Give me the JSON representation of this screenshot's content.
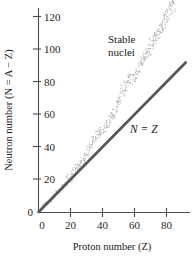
{
  "chart_data": {
    "type": "scatter",
    "title": "",
    "xlabel": "Proton number (Z)",
    "ylabel": "Neutron number (N = A − Z)",
    "xlim": [
      0,
      96
    ],
    "ylim": [
      0,
      132
    ],
    "xticks": [
      0,
      20,
      40,
      60,
      80
    ],
    "yticks": [
      0,
      20,
      40,
      60,
      80,
      100,
      120
    ],
    "grid": false,
    "legend": "none",
    "annotations": [
      {
        "text": "Stable nuclei",
        "x": 52,
        "y": 112
      },
      {
        "text": "N = Z",
        "x": 70,
        "y": 56
      }
    ],
    "series": [
      {
        "name": "N = Z",
        "type": "line",
        "color": "#575757",
        "x": [
          0,
          92
        ],
        "values": [
          0,
          92
        ]
      },
      {
        "name": "Stable nuclei",
        "type": "scatter",
        "color": "#9a9a9a",
        "x": [
          1,
          2,
          3,
          4,
          5,
          6,
          7,
          8,
          9,
          10,
          11,
          12,
          13,
          14,
          15,
          16,
          17,
          18,
          19,
          20,
          21,
          22,
          23,
          24,
          25,
          26,
          27,
          28,
          29,
          30,
          31,
          32,
          33,
          34,
          35,
          36,
          37,
          38,
          39,
          40,
          41,
          42,
          43,
          44,
          45,
          46,
          47,
          48,
          49,
          50,
          51,
          52,
          53,
          54,
          55,
          56,
          57,
          58,
          59,
          60,
          61,
          62,
          63,
          64,
          65,
          66,
          67,
          68,
          69,
          70,
          71,
          72,
          73,
          74,
          75,
          76,
          77,
          78,
          79,
          80,
          81,
          82,
          83,
          84,
          86,
          88,
          90,
          92
        ],
        "values": [
          1,
          2,
          4,
          5,
          6,
          6,
          7,
          8,
          10,
          10,
          12,
          12,
          14,
          14,
          16,
          16,
          18,
          22,
          20,
          20,
          24,
          26,
          28,
          28,
          30,
          30,
          32,
          31,
          35,
          35,
          39,
          41,
          42,
          45,
          45,
          48,
          48,
          50,
          50,
          51,
          52,
          54,
          55,
          57,
          58,
          60,
          61,
          64,
          66,
          69,
          71,
          76,
          74,
          78,
          78,
          82,
          82,
          82,
          82,
          84,
          85,
          88,
          90,
          94,
          94,
          97,
          98,
          98,
          100,
          104,
          104,
          108,
          108,
          110,
          111,
          114,
          115,
          117,
          118,
          121,
          123,
          125,
          126,
          127,
          136,
          138,
          142,
          146
        ]
      }
    ]
  }
}
